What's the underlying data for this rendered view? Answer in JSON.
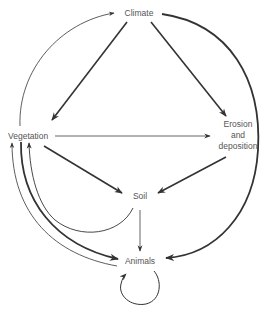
{
  "diagram": {
    "type": "causal-loop / interaction diagram",
    "nodes": {
      "climate": {
        "label": "Climate"
      },
      "vegetation": {
        "label": "Vegetation"
      },
      "erosion": {
        "line1": "Erosion",
        "line2": "and",
        "line3": "deposition"
      },
      "soil": {
        "label": "Soil"
      },
      "animals": {
        "label": "Animals"
      }
    },
    "edges": [
      {
        "from": "Vegetation",
        "to": "Climate",
        "weight": "thin",
        "shape": "curved"
      },
      {
        "from": "Climate",
        "to": "Vegetation",
        "weight": "thick",
        "shape": "straight"
      },
      {
        "from": "Climate",
        "to": "Erosion and deposition",
        "weight": "thick",
        "shape": "straight"
      },
      {
        "from": "Climate",
        "to": "Animals",
        "weight": "thick",
        "shape": "curved"
      },
      {
        "from": "Vegetation",
        "to": "Erosion and deposition",
        "weight": "thin",
        "shape": "straight"
      },
      {
        "from": "Vegetation",
        "to": "Soil",
        "weight": "thick",
        "shape": "straight"
      },
      {
        "from": "Erosion and deposition",
        "to": "Soil",
        "weight": "thick",
        "shape": "straight"
      },
      {
        "from": "Soil",
        "to": "Animals",
        "weight": "thin",
        "shape": "straight"
      },
      {
        "from": "Soil",
        "to": "Vegetation",
        "weight": "thin",
        "shape": "curved"
      },
      {
        "from": "Vegetation",
        "to": "Animals",
        "weight": "thick",
        "shape": "curved"
      },
      {
        "from": "Animals",
        "to": "Vegetation",
        "weight": "thin",
        "shape": "curved"
      },
      {
        "from": "Animals",
        "to": "Animals",
        "weight": "thin",
        "shape": "self-loop"
      }
    ],
    "colors": {
      "line": "#333333",
      "text": "#555555"
    }
  }
}
